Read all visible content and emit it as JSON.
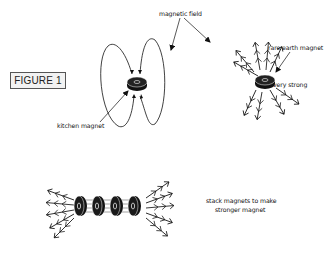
{
  "figure_label": "FIGURE 1",
  "labels": {
    "magnetic_field": "magnetic field",
    "kitchen_magnet": "kitchen magnet",
    "rare_earth_magnet": "rare earth magnet",
    "very_strong": "very strong",
    "stack_line1": "stack magnets to make",
    "stack_line2": "stronger magnet"
  },
  "elements": {
    "kitchen_magnet": {
      "icon": "disc-magnet-icon",
      "field_lines": 4
    },
    "rare_earth_magnet": {
      "icon": "disc-magnet-icon",
      "field_arrows": 11
    },
    "stacked_magnets": {
      "icon": "stacked-disc-magnets-icon",
      "count": 4
    }
  },
  "colors": {
    "ink": "#111111",
    "background": "#ffffff",
    "figure_box": "#f2f2f2"
  }
}
